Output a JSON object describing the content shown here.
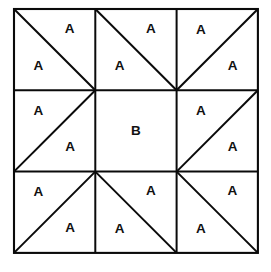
{
  "figure": {
    "geometry": {
      "origin_x": 14,
      "origin_y": 9,
      "cell_size": 81.3,
      "rows": 3,
      "cols": 3,
      "line_color": "#0a0a0a",
      "fill_color": "#ffffff",
      "background": "#ffffff"
    },
    "labels": {
      "triangle_label": "A",
      "square_label": "B"
    },
    "cells": [
      {
        "id": "cell-r1c1",
        "name": "top-left",
        "row": 0,
        "col": 0,
        "diagonal": "backslash",
        "pieces": [
          {
            "label": "A",
            "position": "upper-right"
          },
          {
            "label": "A",
            "position": "lower-left"
          }
        ]
      },
      {
        "id": "cell-r1c2",
        "name": "top-center",
        "row": 0,
        "col": 1,
        "diagonal": "backslash",
        "pieces": [
          {
            "label": "A",
            "position": "upper-right"
          },
          {
            "label": "A",
            "position": "lower-left"
          }
        ]
      },
      {
        "id": "cell-r1c3",
        "name": "top-right",
        "row": 0,
        "col": 2,
        "diagonal": "slash",
        "pieces": [
          {
            "label": "A",
            "position": "upper-left"
          },
          {
            "label": "A",
            "position": "lower-right"
          }
        ]
      },
      {
        "id": "cell-r2c1",
        "name": "middle-left",
        "row": 1,
        "col": 0,
        "diagonal": "slash",
        "pieces": [
          {
            "label": "A",
            "position": "upper-left"
          },
          {
            "label": "A",
            "position": "lower-right"
          }
        ]
      },
      {
        "id": "cell-r2c2",
        "name": "center",
        "row": 1,
        "col": 1,
        "diagonal": "none",
        "pieces": [
          {
            "label": "B",
            "position": "center"
          }
        ]
      },
      {
        "id": "cell-r2c3",
        "name": "middle-right",
        "row": 1,
        "col": 2,
        "diagonal": "slash",
        "pieces": [
          {
            "label": "A",
            "position": "upper-left"
          },
          {
            "label": "A",
            "position": "lower-right"
          }
        ]
      },
      {
        "id": "cell-r3c1",
        "name": "bottom-left",
        "row": 2,
        "col": 0,
        "diagonal": "slash",
        "pieces": [
          {
            "label": "A",
            "position": "upper-left"
          },
          {
            "label": "A",
            "position": "lower-right"
          }
        ]
      },
      {
        "id": "cell-r3c2",
        "name": "bottom-center",
        "row": 2,
        "col": 1,
        "diagonal": "backslash",
        "pieces": [
          {
            "label": "A",
            "position": "upper-right"
          },
          {
            "label": "A",
            "position": "lower-left"
          }
        ]
      },
      {
        "id": "cell-r3c3",
        "name": "bottom-right",
        "row": 2,
        "col": 2,
        "diagonal": "backslash",
        "pieces": [
          {
            "label": "A",
            "position": "upper-right"
          },
          {
            "label": "A",
            "position": "lower-left"
          }
        ]
      }
    ],
    "counts": {
      "triangles_labeled_a": 16,
      "squares_labeled_b": 1,
      "total_cells": 9
    }
  }
}
